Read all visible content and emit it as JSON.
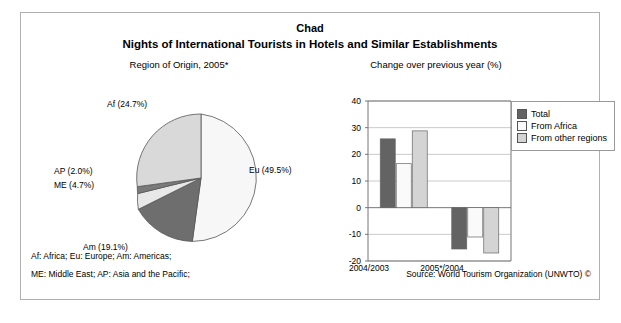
{
  "header": {
    "country": "Chad",
    "title": "Nights of International Tourists in Hotels and Similar Establishments",
    "left_subtitle": "Region of Origin, 2005*",
    "right_subtitle": "Change over previous year (%)"
  },
  "footer": {
    "line1": "Af: Africa; Eu: Europe; Am: Americas;",
    "line2": "ME: Middle East; AP: Asia and the Pacific;",
    "source": "Source: World Tourism Organization (UNWTO) ©"
  },
  "pie_labels": {
    "af": "Af (24.7%)",
    "ap": "AP (2.0%)",
    "me": "ME (4.7%)",
    "am": "Am (19.1%)",
    "eu": "Eu (49.5%)"
  },
  "axis_ticks": [
    "40",
    "30",
    "20",
    "10",
    "0",
    "-10",
    "-20"
  ],
  "legend": [
    {
      "label": "Total",
      "color": "#636363"
    },
    {
      "label": "From Africa",
      "color": "#fafafa"
    },
    {
      "label": "From other regions",
      "color": "#d4d4d4"
    }
  ],
  "chart_data": [
    {
      "type": "pie",
      "title": "Region of Origin, 2005*",
      "labels": [
        "Eu",
        "Am",
        "ME",
        "AP",
        "Af"
      ],
      "label_full": [
        "Europe",
        "Americas",
        "Middle East",
        "Asia and the Pacific",
        "Africa"
      ],
      "values": [
        49.5,
        19.1,
        4.7,
        2.0,
        24.7
      ],
      "units": "percent",
      "colors": [
        "#f7f7f7",
        "#6e6e6e",
        "#e8e8e8",
        "#7a7a7a",
        "#d9d9d9"
      ],
      "legend": "inline-labels",
      "annotations": [
        "Eu (49.5%)",
        "Am (19.1%)",
        "ME (4.7%)",
        "AP (2.0%)",
        "Af (24.7%)"
      ]
    },
    {
      "type": "bar",
      "title": "Change over previous year (%)",
      "categories": [
        "2004/2003",
        "2005*/2004"
      ],
      "series": [
        {
          "name": "Total",
          "values": [
            25.8,
            -15.5
          ],
          "color": "#636363"
        },
        {
          "name": "From Africa",
          "values": [
            16.5,
            -11.0
          ],
          "color": "#fafafa"
        },
        {
          "name": "From other regions",
          "values": [
            28.8,
            -17.0
          ],
          "color": "#d4d4d4"
        }
      ],
      "xlabel": "",
      "ylabel": "",
      "ylim": [
        -20,
        40
      ],
      "ytick_step": 10,
      "yticks": [
        40,
        30,
        20,
        10,
        0,
        -10,
        -20
      ],
      "grid": true,
      "legend_position": "top-right"
    }
  ]
}
